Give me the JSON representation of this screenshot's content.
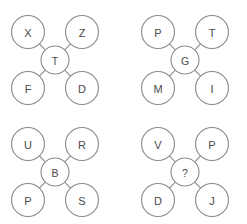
{
  "diagram": {
    "type": "analogy-puzzle",
    "background_color": "#ffffff",
    "stroke_color": "#8a8a8a",
    "text_color": "#4a4a4a",
    "groups": [
      {
        "id": "group-1",
        "origin": {
          "x": 10,
          "y": 14
        },
        "center": {
          "label": "T"
        },
        "nodes": {
          "top_left": "X",
          "top_right": "Z",
          "bottom_left": "F",
          "bottom_right": "D"
        }
      },
      {
        "id": "group-2",
        "origin": {
          "x": 140,
          "y": 14
        },
        "center": {
          "label": "G"
        },
        "nodes": {
          "top_left": "P",
          "top_right": "T",
          "bottom_left": "M",
          "bottom_right": "I"
        }
      },
      {
        "id": "group-3",
        "origin": {
          "x": 10,
          "y": 126
        },
        "center": {
          "label": "B"
        },
        "nodes": {
          "top_left": "U",
          "top_right": "R",
          "bottom_left": "P",
          "bottom_right": "S"
        }
      },
      {
        "id": "group-4",
        "origin": {
          "x": 140,
          "y": 126
        },
        "center": {
          "label": "?"
        },
        "nodes": {
          "top_left": "V",
          "top_right": "P",
          "bottom_left": "D",
          "bottom_right": "J"
        }
      }
    ],
    "geometry": {
      "outer_radius": 16.5,
      "center_radius": 14,
      "outer_positions": {
        "top_left": {
          "cx": 18,
          "cy": 18
        },
        "top_right": {
          "cx": 72,
          "cy": 18
        },
        "bottom_left": {
          "cx": 18,
          "cy": 74
        },
        "bottom_right": {
          "cx": 72,
          "cy": 74
        }
      },
      "center_position": {
        "cx": 45,
        "cy": 46
      }
    }
  }
}
